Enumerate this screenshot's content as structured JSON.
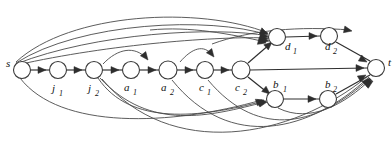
{
  "figure": {
    "type": "directed-graph",
    "background": "#ffffff",
    "stroke_color": "#4a4a4a",
    "node_fill": "#ffffff",
    "node_stroke": "#3a3a3a"
  },
  "nodes": [
    {
      "id": "s",
      "label": "s",
      "sub": "",
      "cx": 22,
      "cy": 70,
      "r": 8.5,
      "label_x": 6,
      "label_y": 67,
      "sub_x": 0,
      "sub_y": 0
    },
    {
      "id": "j1",
      "label": "j",
      "sub": "1",
      "cx": 58,
      "cy": 70,
      "r": 8.5,
      "label_x": 52,
      "label_y": 92,
      "sub_x": 59,
      "sub_y": 96
    },
    {
      "id": "j2",
      "label": "j",
      "sub": "2",
      "cx": 94,
      "cy": 70,
      "r": 8.5,
      "label_x": 88,
      "label_y": 92,
      "sub_x": 95,
      "sub_y": 96
    },
    {
      "id": "a1",
      "label": "a",
      "sub": "1",
      "cx": 131,
      "cy": 70,
      "r": 8.5,
      "label_x": 124,
      "label_y": 91,
      "sub_x": 133,
      "sub_y": 95
    },
    {
      "id": "a2",
      "label": "a",
      "sub": "2",
      "cx": 168,
      "cy": 70,
      "r": 9,
      "label_x": 161,
      "label_y": 91,
      "sub_x": 170,
      "sub_y": 95
    },
    {
      "id": "c1",
      "label": "c",
      "sub": "1",
      "cx": 205,
      "cy": 70,
      "r": 8.5,
      "label_x": 199,
      "label_y": 91,
      "sub_x": 207,
      "sub_y": 95
    },
    {
      "id": "c2",
      "label": "c",
      "sub": "2",
      "cx": 241,
      "cy": 70,
      "r": 9,
      "label_x": 235,
      "label_y": 91,
      "sub_x": 243,
      "sub_y": 95
    },
    {
      "id": "d1",
      "label": "d",
      "sub": "1",
      "cx": 277,
      "cy": 37,
      "r": 8.5,
      "label_x": 285,
      "label_y": 50,
      "sub_x": 293,
      "sub_y": 54
    },
    {
      "id": "d2",
      "label": "d",
      "sub": "2",
      "cx": 329,
      "cy": 36,
      "r": 8.5,
      "label_x": 325,
      "label_y": 50,
      "sub_x": 333,
      "sub_y": 54
    },
    {
      "id": "b1",
      "label": "b",
      "sub": "1",
      "cx": 275,
      "cy": 99,
      "r": 8.5,
      "label_x": 273,
      "label_y": 88,
      "sub_x": 283,
      "sub_y": 92
    },
    {
      "id": "b2",
      "label": "b",
      "sub": "2",
      "cx": 328,
      "cy": 99,
      "r": 8.5,
      "label_x": 325,
      "label_y": 88,
      "sub_x": 333,
      "sub_y": 92
    },
    {
      "id": "t",
      "label": "t",
      "sub": "",
      "cx": 376,
      "cy": 68,
      "r": 8.5,
      "label_x": 388,
      "label_y": 66,
      "sub_x": 0,
      "sub_y": 0
    }
  ],
  "edges": [
    {
      "from": "s",
      "to": "j1",
      "kind": "straight",
      "d": "M 31 70 L 49 70"
    },
    {
      "from": "j1",
      "to": "j2",
      "kind": "straight",
      "d": "M 67 70 L 85 70"
    },
    {
      "from": "j2",
      "to": "a1",
      "kind": "straight",
      "d": "M 103 70 L 122 70"
    },
    {
      "from": "a1",
      "to": "a2",
      "kind": "straight",
      "d": "M 140 70 L 159 70"
    },
    {
      "from": "a2",
      "to": "c1",
      "kind": "straight",
      "d": "M 177 70 L 196 70"
    },
    {
      "from": "c1",
      "to": "c2",
      "kind": "straight",
      "d": "M 214 70 L 232 70"
    },
    {
      "from": "c2",
      "to": "d1",
      "kind": "straight",
      "d": "M 248 63 L 270 44"
    },
    {
      "from": "d1",
      "to": "d2",
      "kind": "straight",
      "d": "M 286 37 L 320 36"
    },
    {
      "from": "d2",
      "to": "t",
      "kind": "straight",
      "d": "M 336 42 L 370 61"
    },
    {
      "from": "c2",
      "to": "b1",
      "kind": "straight",
      "d": "M 248 77 L 268 93"
    },
    {
      "from": "b1",
      "to": "b2",
      "kind": "straight",
      "d": "M 284 99 L 319 99"
    },
    {
      "from": "b2",
      "to": "t",
      "kind": "straight",
      "d": "M 336 94 L 370 75"
    },
    {
      "from": "c2",
      "to": "t",
      "kind": "straight",
      "d": "M 250 70 L 367 68"
    },
    {
      "from": "s",
      "to": "d1",
      "kind": "curve-top",
      "d": "M 16 62 C 70 12 200 6 268 33"
    },
    {
      "from": "s",
      "to": "d1",
      "kind": "curve-top",
      "d": "M 16 63 C 80 22 210 16 268 35"
    },
    {
      "from": "j2",
      "to": "d1",
      "kind": "curve-top",
      "d": "M 16 64 C 95 33 215 26 268 36"
    },
    {
      "from": "a2",
      "to": "d1",
      "kind": "curve-top",
      "d": "M 17 65 C 110 44 220 36 269 38"
    },
    {
      "from": "s",
      "to": "a1",
      "kind": "curve-top",
      "d": "M 103 64 C 118 48 135 46 146 58"
    },
    {
      "from": "j2",
      "to": "c1",
      "kind": "curve-top",
      "d": "M 180 62 C 192 48 204 44 212 55"
    },
    {
      "from": "a2",
      "to": "d1",
      "kind": "curve-top",
      "d": "M 150 30 C 190 26 230 34 266 42"
    },
    {
      "from": "c1",
      "to": "t",
      "kind": "curve-top",
      "d": "M 212 44 C 250 30 300 26 350 30"
    },
    {
      "from": "s",
      "to": "b1",
      "kind": "curve-bot",
      "d": "M 20 78 C 60 130 170 126 262 100"
    },
    {
      "from": "j2",
      "to": "b1",
      "kind": "curve-bot",
      "d": "M 98 78 C 130 126 200 118 264 101"
    },
    {
      "from": "j2",
      "to": "b1",
      "kind": "curve-bot",
      "d": "M 100 78 C 150 132 210 116 265 102"
    },
    {
      "from": "j2",
      "to": "t",
      "kind": "curve-bot",
      "d": "M 102 79 C 170 160 290 140 368 76"
    },
    {
      "from": "a2",
      "to": "t",
      "kind": "curve-bot",
      "d": "M 172 80 C 230 152 310 132 369 77"
    },
    {
      "from": "c1",
      "to": "t",
      "kind": "curve-bot",
      "d": "M 208 80 C 260 142 320 124 370 78"
    },
    {
      "from": "b1",
      "to": "t",
      "kind": "curve-bot",
      "d": "M 278 108 C 310 124 345 104 371 79"
    }
  ],
  "arrowheads": [
    {
      "x": 46,
      "y": 70,
      "angle": 0
    },
    {
      "x": 82,
      "y": 70,
      "angle": 0
    },
    {
      "x": 119,
      "y": 70,
      "angle": 0
    },
    {
      "x": 156,
      "y": 70,
      "angle": 0
    },
    {
      "x": 193,
      "y": 70,
      "angle": 0
    },
    {
      "x": 229,
      "y": 70,
      "angle": 0
    },
    {
      "x": 272,
      "y": 42,
      "angle": -42
    },
    {
      "x": 317,
      "y": 36,
      "angle": 0
    },
    {
      "x": 367,
      "y": 62,
      "angle": 30
    },
    {
      "x": 270,
      "y": 94,
      "angle": 40
    },
    {
      "x": 316,
      "y": 99,
      "angle": 0
    },
    {
      "x": 366,
      "y": 75,
      "angle": -30
    },
    {
      "x": 364,
      "y": 68,
      "angle": 0
    },
    {
      "x": 268,
      "y": 34,
      "angle": 22
    },
    {
      "x": 268,
      "y": 37,
      "angle": 16
    },
    {
      "x": 268,
      "y": 39,
      "angle": 10
    },
    {
      "x": 269,
      "y": 41,
      "angle": 6
    },
    {
      "x": 148,
      "y": 60,
      "angle": 52
    },
    {
      "x": 214,
      "y": 57,
      "angle": 52
    },
    {
      "x": 266,
      "y": 43,
      "angle": 14
    },
    {
      "x": 352,
      "y": 31,
      "angle": 12
    },
    {
      "x": 264,
      "y": 100,
      "angle": -18
    },
    {
      "x": 266,
      "y": 101,
      "angle": -14
    },
    {
      "x": 267,
      "y": 102,
      "angle": -12
    },
    {
      "x": 370,
      "y": 78,
      "angle": -46
    },
    {
      "x": 371,
      "y": 79,
      "angle": -42
    },
    {
      "x": 372,
      "y": 80,
      "angle": -38
    },
    {
      "x": 373,
      "y": 81,
      "angle": -34
    }
  ],
  "accents": {
    "ink": "#2e2e2e",
    "edge": "#4a4a4a"
  }
}
